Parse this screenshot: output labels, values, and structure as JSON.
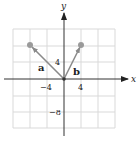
{
  "diagram": {
    "type": "coordinate-plane-vectors",
    "axes": {
      "x_label": "x",
      "y_label": "y",
      "tick_labels": {
        "x_neg": "−4",
        "x_pos": "4",
        "y_pos": "4",
        "y_neg": "−8"
      },
      "grid_step": 4,
      "range": [
        -12,
        12
      ]
    },
    "vectors": [
      {
        "name": "a",
        "label": "a",
        "from": [
          0,
          0
        ],
        "to": [
          -8,
          8
        ]
      },
      {
        "name": "b",
        "label": "b",
        "from": [
          0,
          0
        ],
        "to": [
          4,
          8
        ]
      }
    ],
    "colors": {
      "grid": "#d9d9d9",
      "axis": "#333333",
      "vector": "#8a8a8a",
      "point": "#9a9a9a"
    }
  }
}
